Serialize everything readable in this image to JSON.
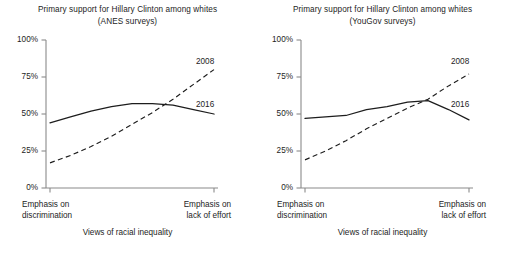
{
  "figure": {
    "width": 510,
    "height": 257,
    "background": "#ffffff",
    "ink_color": "#1d1d1d"
  },
  "panels": [
    {
      "key": "anes",
      "title_line1": "Primary support for Hillary Clinton among whites",
      "title_line2": "(ANES surveys)",
      "ytick_labels": [
        "100%",
        "75%",
        "50%",
        "25%",
        "0%"
      ],
      "xcat_left_line1": "Emphasis on",
      "xcat_left_line2": "discrimination",
      "xcat_right_line1": "Emphasis on",
      "xcat_right_line2": "lack of effort",
      "axis_title": "Views of racial inequality",
      "label_2008": "2008",
      "label_2016": "2016"
    },
    {
      "key": "yougov",
      "title_line1": "Primary support for Hillary Clinton among whites",
      "title_line2": "(YouGov surveys)",
      "ytick_labels": [
        "100%",
        "75%",
        "50%",
        "25%",
        "0%"
      ],
      "xcat_left_line1": "Emphasis on",
      "xcat_left_line2": "discrimination",
      "xcat_right_line1": "Emphasis on",
      "xcat_right_line2": "lack of effort",
      "axis_title": "Views of racial inequality",
      "label_2008": "2008",
      "label_2016": "2016"
    }
  ],
  "chart_data": [
    {
      "type": "line",
      "panel": "anes",
      "title": "Primary support for Hillary Clinton among whites (ANES surveys)",
      "xlabel": "Views of racial inequality",
      "ylabel": "",
      "ylim": [
        0,
        100
      ],
      "yticks": [
        0,
        25,
        50,
        75,
        100
      ],
      "ytick_labels": [
        "0%",
        "25%",
        "50%",
        "75%",
        "100%"
      ],
      "xlim": [
        0,
        1
      ],
      "xtick_labels": [
        "Emphasis on discrimination",
        "Emphasis on lack of effort"
      ],
      "grid": false,
      "legend": "inline-end-of-line",
      "x": [
        0,
        0.125,
        0.25,
        0.375,
        0.5,
        0.625,
        0.75,
        0.875,
        1
      ],
      "series": [
        {
          "name": "2016",
          "style": "solid",
          "color": "#1d1d1d",
          "values": [
            44,
            48,
            52,
            55,
            57,
            57,
            56,
            53,
            50
          ]
        },
        {
          "name": "2008",
          "style": "dashed",
          "color": "#1d1d1d",
          "values": [
            17,
            22,
            28,
            35,
            43,
            51,
            60,
            70,
            80
          ]
        }
      ],
      "annotations": [
        {
          "text": "2008",
          "x": 1.0,
          "y": 88
        },
        {
          "text": "2016",
          "x": 1.0,
          "y": 57
        }
      ]
    },
    {
      "type": "line",
      "panel": "yougov",
      "title": "Primary support for Hillary Clinton among whites (YouGov surveys)",
      "xlabel": "Views of racial inequality",
      "ylabel": "",
      "ylim": [
        0,
        100
      ],
      "yticks": [
        0,
        25,
        50,
        75,
        100
      ],
      "ytick_labels": [
        "0%",
        "25%",
        "50%",
        "75%",
        "100%"
      ],
      "xlim": [
        0,
        1
      ],
      "xtick_labels": [
        "Emphasis on discrimination",
        "Emphasis on lack of effort"
      ],
      "grid": false,
      "legend": "inline-end-of-line",
      "x": [
        0,
        0.125,
        0.25,
        0.375,
        0.5,
        0.625,
        0.75,
        0.875,
        1
      ],
      "series": [
        {
          "name": "2016",
          "style": "solid",
          "color": "#1d1d1d",
          "values": [
            47,
            48,
            49,
            53,
            55,
            58,
            59,
            53,
            46
          ]
        },
        {
          "name": "2008",
          "style": "dashed",
          "color": "#1d1d1d",
          "values": [
            19,
            25,
            32,
            40,
            47,
            54,
            60,
            69,
            77
          ]
        }
      ],
      "annotations": [
        {
          "text": "2008",
          "x": 1.0,
          "y": 86
        },
        {
          "text": "2016",
          "x": 1.0,
          "y": 57
        }
      ]
    }
  ],
  "geometry": {
    "plot_left": 46,
    "plot_right": 218,
    "plot_top": 40,
    "plot_bottom": 188
  }
}
